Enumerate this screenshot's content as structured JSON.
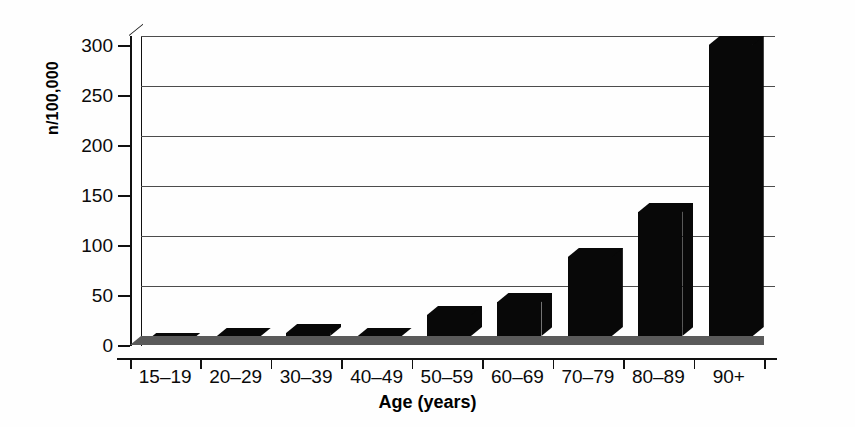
{
  "chart_data": {
    "type": "bar",
    "title": "",
    "xlabel": "Age (years)",
    "ylabel": "n/100,000",
    "categories": [
      "15–19",
      "20–29",
      "30–39",
      "40–49",
      "50–59",
      "60–69",
      "70–79",
      "80–89",
      "90+"
    ],
    "values": [
      3,
      8,
      12,
      8,
      30,
      43,
      88,
      133,
      300
    ],
    "ylim": [
      0,
      300
    ],
    "yticks": [
      0,
      50,
      100,
      150,
      200,
      250,
      300
    ],
    "ytick_labels": [
      "0",
      "50",
      "100",
      "150",
      "200",
      "250",
      "300"
    ],
    "grid": true,
    "legend": null,
    "style": "3d-bar",
    "bar_color": "#080808",
    "floor_color": "#5a5a5a",
    "gridline_color": "#4c4c4c",
    "background": "#ffffff"
  }
}
